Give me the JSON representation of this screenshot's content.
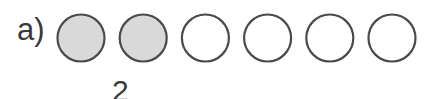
{
  "diagram": {
    "label": "a)",
    "count_label": "2",
    "circles": [
      {
        "filled": true
      },
      {
        "filled": true
      },
      {
        "filled": false
      },
      {
        "filled": false
      },
      {
        "filled": false
      },
      {
        "filled": false
      }
    ],
    "colors": {
      "fill": "#d9d9d9",
      "stroke": "#4a4a4a",
      "empty": "#ffffff"
    }
  }
}
